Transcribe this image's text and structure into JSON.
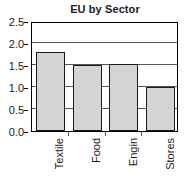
{
  "chart_data": {
    "type": "bar",
    "title": "EU by Sector",
    "xlabel": "",
    "ylabel": "",
    "categories": [
      "Textile",
      "Food",
      "Engin",
      "Stores"
    ],
    "values": [
      1.79,
      1.49,
      1.52,
      0.99
    ],
    "ylim": [
      0.0,
      2.5
    ],
    "ytick_labels": [
      "0.0",
      "0.5",
      "1.0",
      "1.5",
      "2.0",
      "2.5"
    ],
    "ytick_values": [
      0.0,
      0.5,
      1.0,
      1.5,
      2.0,
      2.5
    ],
    "grid": true,
    "grid_axis": "y",
    "legend": false,
    "legend_position": "none",
    "bar_fill_color": "#d4d4d4",
    "bar_edge_color": "#1a1a1a",
    "axis_color": "#000000",
    "gridline_color": "#555555",
    "text_color": "#1a1a1a",
    "background_color": "#ffffff",
    "xtick_label_rotation": 90
  }
}
